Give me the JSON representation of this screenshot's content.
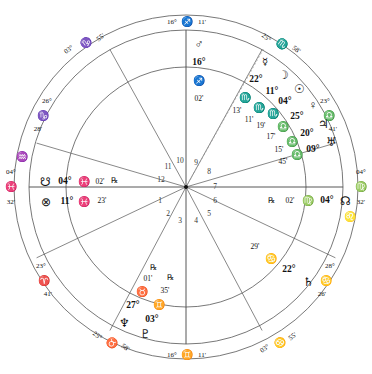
{
  "chart": {
    "type": "astrological-wheel",
    "center": {
      "x": 186,
      "y": 187
    },
    "radii": {
      "outer": 173,
      "ring_inner": 158,
      "house_ring": 120,
      "inner": 0
    },
    "colors": {
      "line": "#555555",
      "text": "#111111",
      "dashed": "#888888"
    }
  },
  "axis_labels": {
    "midheaven": {
      "deg": "16°",
      "sign": "♐",
      "min": "11'"
    },
    "imum_coeli": {
      "deg": "16°",
      "sign": "♊",
      "min": "11'"
    },
    "ascendant": {
      "deg": "04°",
      "sign": "♓",
      "min": "32'"
    },
    "descendant": {
      "deg": "04°",
      "sign": "♍",
      "min": "32'"
    }
  },
  "cusps": [
    {
      "name": "cusp-11",
      "deg": "03°",
      "sign": "♑",
      "min": "55'"
    },
    {
      "name": "cusp-12",
      "deg": "26°",
      "sign": "♑",
      "min": "28'"
    },
    {
      "name": "cusp-2",
      "deg": "23°",
      "sign": "♈",
      "min": "41'"
    },
    {
      "name": "cusp-3",
      "deg": "25°",
      "sign": "♉",
      "min": "58'"
    },
    {
      "name": "cusp-5",
      "deg": "03°",
      "sign": "♋",
      "min": "55'"
    },
    {
      "name": "cusp-6",
      "deg": "28°",
      "sign": "♋",
      "min": "26'"
    },
    {
      "name": "cusp-8",
      "deg": "23°",
      "sign": "♎",
      "min": "41'"
    },
    {
      "name": "cusp-9",
      "deg": "25°",
      "sign": "♏",
      "min": "58'"
    }
  ],
  "ring_signs": [
    {
      "name": "ring-sign-aquarius",
      "glyph": "♒"
    },
    {
      "name": "ring-sign-pisces",
      "glyph": "♓"
    },
    {
      "name": "ring-sign-virgo",
      "glyph": "♍"
    },
    {
      "name": "ring-sign-leo",
      "glyph": "♌"
    }
  ],
  "house_numbers": [
    "1",
    "2",
    "3",
    "4",
    "5",
    "6",
    "7",
    "8",
    "9",
    "10",
    "11",
    "12"
  ],
  "planets": [
    {
      "name": "mars",
      "glyph": "♂",
      "deg": "16°",
      "sign": "♐",
      "min": "02'",
      "retro": ""
    },
    {
      "name": "mercury",
      "glyph": "☿",
      "deg": "22°",
      "sign": "♏",
      "min": "13'",
      "retro": ""
    },
    {
      "name": "moon",
      "glyph": "☽",
      "deg": "11°",
      "sign": "♏",
      "min": "11'",
      "retro": ""
    },
    {
      "name": "sun",
      "glyph": "☉",
      "deg": "04°",
      "sign": "♏",
      "min": "19'",
      "retro": ""
    },
    {
      "name": "venus",
      "glyph": "♀",
      "deg": "25°",
      "sign": "♎",
      "min": "17'",
      "retro": ""
    },
    {
      "name": "jupiter",
      "glyph": "♃",
      "deg": "20°",
      "sign": "♎",
      "min": "15'",
      "retro": ""
    },
    {
      "name": "uranus",
      "glyph": "♅",
      "deg": "09°",
      "sign": "♎",
      "min": "45'",
      "retro": ""
    },
    {
      "name": "saturn",
      "glyph": "♄",
      "deg": "22°",
      "sign": "♋",
      "min": "29'",
      "retro": ""
    },
    {
      "name": "neptune",
      "glyph": "♆",
      "deg": "27°",
      "sign": "♉",
      "min": "01'",
      "retro": "℞"
    },
    {
      "name": "pluto",
      "glyph": "♇",
      "deg": "03°",
      "sign": "♊",
      "min": "35'",
      "retro": "℞"
    }
  ],
  "points": [
    {
      "name": "south-node",
      "glyph": "☋",
      "deg": "04°",
      "sign": "♓",
      "min": "02'",
      "retro": "℞"
    },
    {
      "name": "part-of-fortune",
      "glyph": "⊗",
      "deg": "11°",
      "sign": "♓",
      "min": "23'",
      "retro": ""
    },
    {
      "name": "north-node",
      "glyph": "☊",
      "deg": "04°",
      "sign": "♍",
      "min": "02'",
      "retro": "℞"
    }
  ]
}
